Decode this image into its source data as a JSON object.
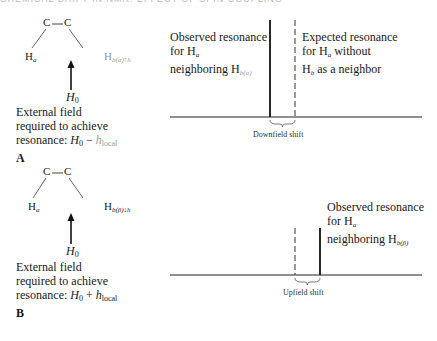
{
  "header": {
    "text": "CHEMICAL SHIFT IN NMR: EFFECT OF SPIN COUPLING"
  },
  "panel_a": {
    "label": "A",
    "atom_c1": "C",
    "atom_c2": "C",
    "h_left": "H",
    "h_left_sub": "a",
    "h_right": "H",
    "h_right_sub": "b(α)↑h",
    "field_symbol": "H",
    "field_sub": "0",
    "caption_line1": "External field",
    "caption_line2": "required to achieve",
    "caption_line3_prefix": "resonance: ",
    "caption_formula": "H",
    "caption_formula_sub": "0",
    "caption_op": " − ",
    "caption_h": "h",
    "caption_h_sub": "local",
    "observed_line1": "Observed resonance",
    "observed_line2": "for H",
    "observed_line2_sub": "a",
    "observed_line3": "neighboring H",
    "observed_line3_sub": "b(α)",
    "expected_line1": "Expected resonance",
    "expected_line2a": "for H",
    "expected_line2_sub": "a",
    "expected_line2b": " without",
    "expected_line3a": "H",
    "expected_line3_sub": "b",
    "expected_line3b": " as a neighbor",
    "shift_label": "Downfield shift"
  },
  "panel_b": {
    "label": "B",
    "atom_c1": "C",
    "atom_c2": "C",
    "h_left": "H",
    "h_left_sub": "a",
    "h_right": "H",
    "h_right_sub": "b(β)↓h",
    "field_symbol": "H",
    "field_sub": "0",
    "caption_line1": "External field",
    "caption_line2": "required to achieve",
    "caption_line3_prefix": "resonance: ",
    "caption_formula": "H",
    "caption_formula_sub": "0",
    "caption_op": " + ",
    "caption_h": "h",
    "caption_h_sub": "local",
    "observed_line1": "Observed resonance",
    "observed_line2": "for H",
    "observed_line2_sub": "a",
    "observed_line3": "neighboring H",
    "observed_line3_sub": "b(β)",
    "shift_label": "Upfield shift"
  },
  "colors": {
    "line": "#1a1a1a",
    "faded_text": "#9a9a9a"
  }
}
